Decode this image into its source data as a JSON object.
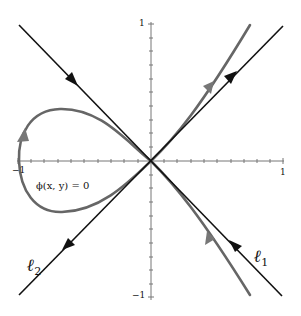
{
  "figure": {
    "type": "phase-portrait",
    "axes": {
      "x_range": [
        -1,
        1
      ],
      "y_range": [
        -1,
        1
      ],
      "tick_labels": {
        "x_pos": "1",
        "x_neg": "−1",
        "y_pos": "1",
        "y_neg": "−1"
      }
    },
    "lines": [
      {
        "id": "l1",
        "label_main": "ℓ",
        "label_sub": "1",
        "color": "#111111"
      },
      {
        "id": "l2",
        "label_main": "ℓ",
        "label_sub": "2",
        "color": "#111111"
      }
    ],
    "curve": {
      "label": "ϕ(x, y) = 0",
      "color": "#666666"
    }
  }
}
